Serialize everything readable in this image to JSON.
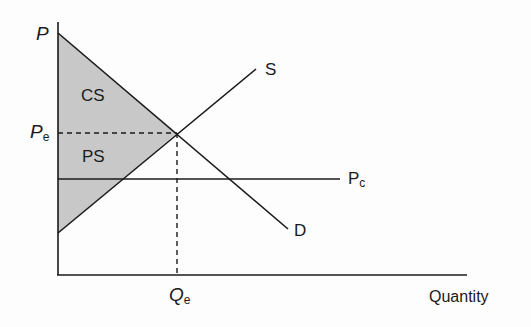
{
  "diagram": {
    "type": "supply-demand-surplus",
    "colors": {
      "line": "#1a1a1a",
      "shade": "#c8c8c8",
      "background": "#fdfdfd"
    },
    "axes": {
      "y_label": "P",
      "x_label": "Quantity"
    },
    "curves": {
      "supply_label": "S",
      "demand_label": "D",
      "price_ceiling_label_main": "P",
      "price_ceiling_label_sub": "c"
    },
    "equilibrium": {
      "price_label_main": "P",
      "price_label_sub": "e",
      "quantity_label_main": "Q",
      "quantity_label_sub": "e"
    },
    "regions": {
      "consumer_surplus": "CS",
      "producer_surplus": "PS"
    }
  }
}
